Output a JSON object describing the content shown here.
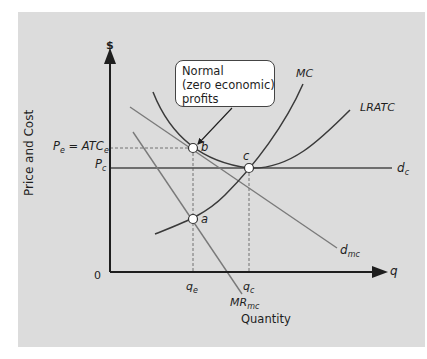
{
  "diagram": {
    "y_axis": {
      "symbol": "$",
      "title": "Price and Cost"
    },
    "x_axis": {
      "symbol": "q",
      "title": "Quantity",
      "origin": "0"
    },
    "price_labels": {
      "pe_atce": {
        "main": "P",
        "sub": "e",
        "eq": " = ",
        "atc": "ATC",
        "atc_sub": "e"
      },
      "pc": {
        "main": "P",
        "sub": "c"
      }
    },
    "quantity_labels": {
      "qe": {
        "main": "q",
        "sub": "e"
      },
      "qc": {
        "main": "q",
        "sub": "c"
      }
    },
    "curves": {
      "mc": {
        "label": "MC"
      },
      "lratc": {
        "label": "LRATC"
      },
      "dc": {
        "main": "d",
        "sub": "c"
      },
      "dmc": {
        "main": "d",
        "sub": "mc"
      },
      "mrmc": {
        "main": "MR",
        "sub": "mc"
      }
    },
    "points": {
      "a": "a",
      "b": "b",
      "c": "c"
    },
    "callout": {
      "lines": [
        "Normal",
        "(zero economic)",
        "profits"
      ]
    },
    "colors": {
      "panel_bg": "#dcdcdc",
      "axis": "#1e1e1e",
      "curve_dark": "#3a3a3a",
      "curve_light": "#7a7a7a",
      "point_fill": "#ffffff"
    }
  }
}
